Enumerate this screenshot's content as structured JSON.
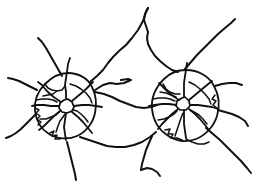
{
  "document": {
    "title": "Road Network Sketch",
    "type": "line-diagram",
    "background_color": "#ffffff",
    "stroke_color": "#111111",
    "width": 266,
    "height": 191
  },
  "diagram": {
    "clusters": [
      {
        "name": "left-hub",
        "label": "",
        "center_x": 68,
        "center_y": 106,
        "ring_radius": 32,
        "spoke_count": 8
      },
      {
        "name": "right-hub",
        "label": "",
        "center_x": 186,
        "center_y": 104,
        "ring_radius": 34,
        "spoke_count": 8
      }
    ],
    "stroke_width_major": 1.9,
    "stroke_width_minor": 1.5,
    "paths": [
      {
        "name": "left-hub-core-loop",
        "kind": "hub-core",
        "stroke_width": 1.7,
        "d": "M64 100 L60 103 L59 108 L62 112 L67 113 L72 111 L74 107 L72 102 L68 99 Z"
      },
      {
        "name": "right-hub-core-loop",
        "kind": "hub-core",
        "stroke_width": 1.7,
        "d": "M182 98 L177 101 L176 106 L180 110 L186 110 L190 106 L189 101 L185 97 Z"
      },
      {
        "name": "left-ring-road",
        "kind": "ring",
        "stroke_width": 1.8,
        "d": "M68 73 C78 73 88 78 92 87 C96 95 97 104 95 113 C93 123 86 132 77 136 C68 140 57 139 49 134 C41 129 36 120 35 111 C34 101 38 91 45 84 C52 77 60 73 68 73 Z"
      },
      {
        "name": "right-ring-road",
        "kind": "ring",
        "stroke_width": 1.8,
        "d": "M186 70 C198 70 209 76 214 86 C219 95 220 106 217 116 C214 126 206 135 196 139 C186 143 175 141 167 135 C158 129 153 119 152 109 C151 98 156 87 164 79 C170 73 178 70 186 70 Z"
      },
      {
        "name": "left-spoke-north",
        "kind": "spoke",
        "stroke_width": 1.8,
        "d": "M66 99 L66 92 L65 85 L66 78 L67 72 L68 64 L70 58"
      },
      {
        "name": "left-spoke-northwest",
        "kind": "spoke",
        "stroke_width": 1.8,
        "d": "M61 102 L55 98 L50 94 L46 90 L42 85 L38 82"
      },
      {
        "name": "left-spoke-west",
        "kind": "spoke",
        "stroke_width": 1.8,
        "d": "M59 106 L51 106 L44 105 L37 105 L32 106"
      },
      {
        "name": "left-spoke-southwest",
        "kind": "spoke",
        "stroke_width": 1.8,
        "d": "M60 111 L54 116 L49 121 L44 126 L39 130"
      },
      {
        "name": "left-spoke-south",
        "kind": "spoke",
        "stroke_width": 1.8,
        "d": "M66 113 L65 120 L64 127 L65 134 L66 140"
      },
      {
        "name": "left-spoke-southeast",
        "kind": "spoke",
        "stroke_width": 1.8,
        "d": "M72 112 L78 117 L83 122 L88 128 L92 133"
      },
      {
        "name": "left-spoke-east",
        "kind": "spoke",
        "stroke_width": 1.8,
        "d": "M74 106 L82 105 L89 105 L96 106 L102 107"
      },
      {
        "name": "left-spoke-northeast",
        "kind": "spoke",
        "stroke_width": 1.8,
        "d": "M72 101 L78 96 L84 91 L89 86 L93 82"
      },
      {
        "name": "right-spoke-north",
        "kind": "spoke",
        "stroke_width": 1.8,
        "d": "M184 97 L184 90 L184 83 L185 76 L186 70 L187 63"
      },
      {
        "name": "right-spoke-northwest",
        "kind": "spoke",
        "stroke_width": 1.8,
        "d": "M179 100 L173 96 L168 92 L163 87 L159 83"
      },
      {
        "name": "right-spoke-west",
        "kind": "spoke",
        "stroke_width": 1.8,
        "d": "M176 105 L169 104 L162 104 L155 105 L149 106"
      },
      {
        "name": "right-spoke-southwest",
        "kind": "spoke",
        "stroke_width": 1.8,
        "d": "M178 109 L172 114 L167 119 L162 124 L158 129"
      },
      {
        "name": "right-spoke-south",
        "kind": "spoke",
        "stroke_width": 1.8,
        "d": "M184 110 L184 117 L184 124 L185 131 L186 138"
      },
      {
        "name": "right-spoke-southeast",
        "kind": "spoke",
        "stroke_width": 1.8,
        "d": "M189 109 L195 114 L200 119 L205 125 L209 130"
      },
      {
        "name": "right-spoke-east",
        "kind": "spoke",
        "stroke_width": 1.8,
        "d": "M191 105 L198 105 L205 106 L212 107 L218 109"
      },
      {
        "name": "right-spoke-northeast",
        "kind": "spoke",
        "stroke_width": 1.8,
        "d": "M189 100 L195 95 L201 90 L207 85 L212 81"
      },
      {
        "name": "arterial-inter-hub-upper",
        "kind": "arterial",
        "stroke_width": 2.0,
        "d": "M95 90 L103 85 L110 83 L117 84 L124 83 L131 80 L128 79 L121 80"
      },
      {
        "name": "arterial-inter-hub-main",
        "kind": "arterial",
        "stroke_width": 2.0,
        "d": "M95 92 L104 94 L112 97 L120 101 L128 104 L136 107 L144 108 L151 107 L157 105"
      },
      {
        "name": "arterial-inter-hub-lower",
        "kind": "arterial",
        "stroke_width": 2.0,
        "d": "M80 137 L89 140 L98 143 L107 146 L116 147 L125 147 L134 145 L142 142 L150 137 L156 132"
      },
      {
        "name": "radial-out-top-peak",
        "kind": "radial-out",
        "stroke_width": 2.0,
        "d": "M90 82 L97 76 L103 70 L108 63 L113 57 L119 51 L126 45 L132 38 L138 30 L143 21 L146 12 L148 8"
      },
      {
        "name": "radial-out-top-descend",
        "kind": "radial-out",
        "stroke_width": 2.0,
        "d": "M148 8 L145 14 L144 20 L146 26 L148 32 L147 38 L148 44 L151 50 L155 56 L160 61 L166 66 L172 70 L178 72"
      },
      {
        "name": "radial-out-topright",
        "kind": "radial-out",
        "stroke_width": 2.0,
        "d": "M185 69 L191 62 L197 55 L204 48 L211 41 L218 34 L225 28 L231 23 L235 19"
      },
      {
        "name": "radial-out-northwest-long",
        "kind": "radial-out",
        "stroke_width": 2.0,
        "d": "M62 76 L58 69 L54 62 L50 55 L46 48 L42 42 L38 38"
      },
      {
        "name": "radial-out-west-upper",
        "kind": "radial-out",
        "stroke_width": 2.0,
        "d": "M37 90 L31 87 L25 84 L19 81 L13 79 L8 78"
      },
      {
        "name": "radial-out-west-lower",
        "kind": "radial-out",
        "stroke_width": 2.0,
        "d": "M36 114 L31 119 L26 124 L21 129 L16 133 L11 136 L6 138"
      },
      {
        "name": "radial-out-south-left",
        "kind": "radial-out",
        "stroke_width": 2.0,
        "d": "M67 142 L69 150 L71 158 L73 166 L75 174 L76 180"
      },
      {
        "name": "radial-out-south-mid",
        "kind": "radial-out",
        "stroke_width": 2.0,
        "d": "M152 136 L149 143 L146 150 L144 157 L142 164 L141 170"
      },
      {
        "name": "radial-out-south-mid-branch",
        "kind": "radial-out",
        "stroke_width": 2.0,
        "d": "M141 170 L147 168 L152 169 L157 172 L160 176"
      },
      {
        "name": "radial-out-southeast",
        "kind": "radial-out",
        "stroke_width": 2.0,
        "d": "M206 128 L213 134 L220 140 L227 147 L234 154 L241 161 L247 168 L251 173"
      },
      {
        "name": "radial-out-east",
        "kind": "radial-out",
        "stroke_width": 2.0,
        "d": "M218 110 L225 112 L232 114 L239 117 L245 121 L248 126"
      },
      {
        "name": "radial-out-east-upper",
        "kind": "radial-out",
        "stroke_width": 2.0,
        "d": "M215 86 L222 84 L229 83 L236 83 L242 85"
      },
      {
        "name": "left-lane-inner-nw",
        "kind": "minor",
        "stroke_width": 1.5,
        "d": "M45 84 L48 88 L52 90 L57 91 L62 90 L65 86"
      },
      {
        "name": "left-lane-inner-ne",
        "kind": "minor",
        "stroke_width": 1.5,
        "d": "M70 84 L76 86 L81 89 L86 93 L90 98 L92 103"
      },
      {
        "name": "left-lane-inner-w",
        "kind": "minor",
        "stroke_width": 1.5,
        "d": "M36 100 L42 99 L48 99 L53 100 L57 102"
      },
      {
        "name": "left-lane-inner-sw",
        "kind": "minor",
        "stroke_width": 1.5,
        "d": "M40 119 L46 119 L51 117 L56 115 L59 112"
      },
      {
        "name": "left-lane-inner-s",
        "kind": "minor",
        "stroke_width": 1.5,
        "d": "M56 132 L58 126 L60 121 L63 117 L65 114"
      },
      {
        "name": "left-lane-inner-se",
        "kind": "minor",
        "stroke_width": 1.5,
        "d": "M88 122 L85 118 L81 114 L77 111 L73 110"
      },
      {
        "name": "left-lane-crosstown",
        "kind": "minor",
        "stroke_width": 1.5,
        "d": "M43 96 L48 95 L53 94 L57 91"
      },
      {
        "name": "left-lane-wiggle-west",
        "kind": "minor",
        "stroke_width": 1.5,
        "d": "M35 108 L39 110 L36 113 L40 116 L37 119 L41 122 L38 125"
      },
      {
        "name": "left-lane-wiggle-south",
        "kind": "minor",
        "stroke_width": 1.5,
        "d": "M50 133 L54 131 L52 136 L57 135 L55 139 L60 139"
      },
      {
        "name": "right-lane-inner-nw",
        "kind": "minor",
        "stroke_width": 1.5,
        "d": "M163 84 L166 89 L170 92 L175 94 L180 94"
      },
      {
        "name": "right-lane-inner-ne",
        "kind": "minor",
        "stroke_width": 1.5,
        "d": "M189 82 L195 85 L200 89 L205 94 L209 99 L211 104"
      },
      {
        "name": "right-lane-inner-w",
        "kind": "minor",
        "stroke_width": 1.5,
        "d": "M153 99 L159 98 L165 98 L170 99 L175 101"
      },
      {
        "name": "right-lane-inner-sw",
        "kind": "minor",
        "stroke_width": 1.5,
        "d": "M158 120 L164 119 L169 117 L174 114 L177 111"
      },
      {
        "name": "right-lane-inner-s",
        "kind": "minor",
        "stroke_width": 1.5,
        "d": "M175 136 L177 130 L179 124 L181 118 L183 113"
      },
      {
        "name": "right-lane-inner-se",
        "kind": "minor",
        "stroke_width": 1.5,
        "d": "M207 124 L203 119 L199 115 L194 112 L190 110"
      },
      {
        "name": "right-lane-crosstown",
        "kind": "minor",
        "stroke_width": 1.5,
        "d": "M160 92 L166 93 L171 95 L176 97"
      },
      {
        "name": "right-lane-wiggle-south",
        "kind": "minor",
        "stroke_width": 1.5,
        "d": "M165 130 L170 129 L168 134 L173 134 L171 138 L177 138 L182 140"
      },
      {
        "name": "right-lane-wiggle-east",
        "kind": "minor",
        "stroke_width": 1.5,
        "d": "M215 95 L212 99 L216 101 L213 105 L217 108"
      },
      {
        "name": "right-lane-connector-bottom",
        "kind": "minor",
        "stroke_width": 1.5,
        "d": "M186 139 L192 142 L198 144 L204 144 L209 142"
      }
    ]
  }
}
